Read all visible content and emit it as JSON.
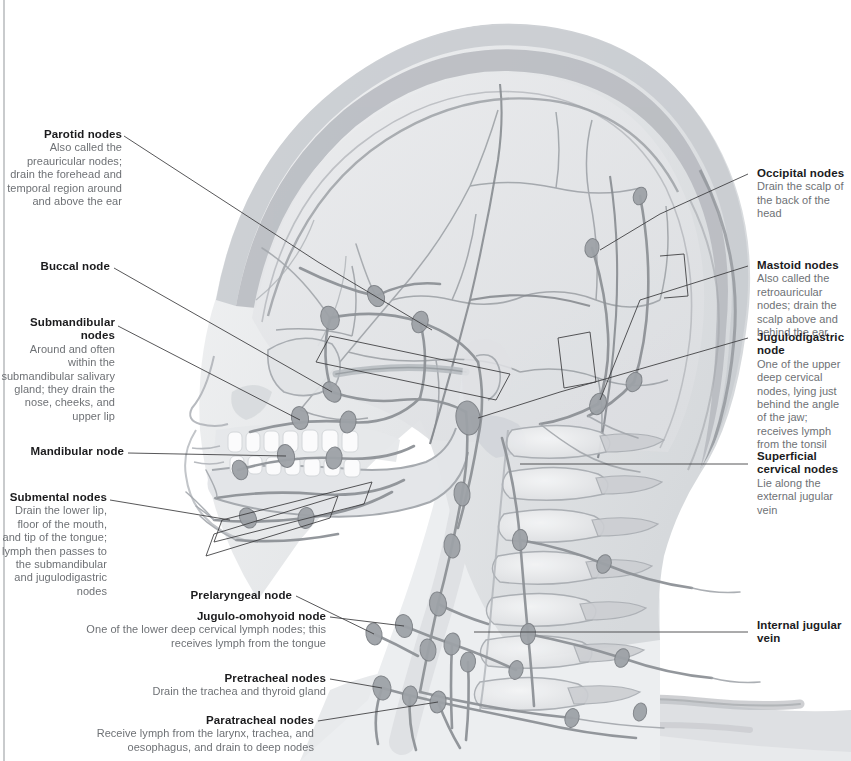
{
  "figure": {
    "view": "lateral (left side) x-ray style translucent anatomical illustration",
    "style_colors": {
      "background": "#ffffff",
      "heading_text": "#1b1b1d",
      "body_text": "#6e7175",
      "leader_line": "#3a3a3c",
      "edge_rule": "#c9cbcd",
      "tissue_light": "#e9eaec",
      "tissue_mid": "#d2d4d7",
      "tissue_dark": "#b9bcc0",
      "vessel": "#8d9196",
      "node_fill": "#9ea2a7"
    }
  },
  "labels_left": [
    {
      "id": "parotid-nodes",
      "heading": "Parotid nodes",
      "body": "Also called the preauricular nodes; drain the forehead and temporal region around and above the ear"
    },
    {
      "id": "buccal-node",
      "heading": "Buccal node",
      "body": ""
    },
    {
      "id": "submandibular-nodes",
      "heading": "Submandibular nodes",
      "body": "Around and often within the submandibular salivary gland; they drain the nose, cheeks, and upper lip"
    },
    {
      "id": "mandibular-node",
      "heading": "Mandibular node",
      "body": ""
    },
    {
      "id": "submental-nodes",
      "heading": "Submental nodes",
      "body": "Drain the lower lip, floor of the mouth, and tip of the tongue; lymph then passes to the submandibular and jugulodigastric nodes"
    }
  ],
  "labels_bottom": [
    {
      "id": "prelaryngeal-node",
      "heading": "Prelaryngeal node",
      "body": ""
    },
    {
      "id": "jugulo-omohyoid-node",
      "heading": "Jugulo-omohyoid node",
      "body": "One of the lower deep cervical lymph nodes; this receives lymph from the tongue"
    },
    {
      "id": "pretracheal-nodes",
      "heading": "Pretracheal nodes",
      "body": "Drain the trachea and thyroid gland"
    },
    {
      "id": "paratracheal-nodes",
      "heading": "Paratracheal nodes",
      "body": "Receive lymph from the larynx, trachea, and oesophagus, and drain to deep nodes"
    }
  ],
  "labels_right": [
    {
      "id": "occipital-nodes",
      "heading": "Occipital nodes",
      "body": "Drain the scalp of the back of the head"
    },
    {
      "id": "mastoid-nodes",
      "heading": "Mastoid nodes",
      "body": "Also called the retroauricular nodes; drain the scalp above and behind the ear"
    },
    {
      "id": "jugulodigastric-node",
      "heading": "Jugulodigastric node",
      "body": "One of the upper deep cervical nodes, lying just behind the angle of the jaw; receives lymph from the tonsil"
    },
    {
      "id": "superficial-cervical-nodes",
      "heading": "Superficial cervical nodes",
      "body": "Lie along the external jugular vein"
    },
    {
      "id": "internal-jugular-vein",
      "heading": "Internal jugular vein",
      "body": ""
    }
  ]
}
